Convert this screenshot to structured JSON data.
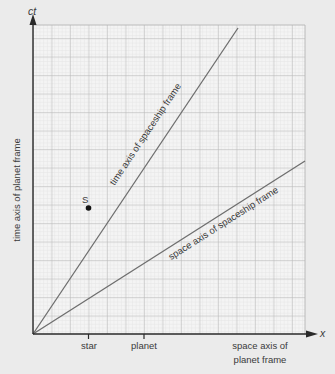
{
  "diagram": {
    "type": "spacetime-diagram",
    "axes": {
      "vertical": {
        "symbol": "ct",
        "label": "time axis of planet frame"
      },
      "horizontal": {
        "symbol": "x",
        "label_line1": "space axis of",
        "label_line2": "planet frame"
      }
    },
    "moving_frame": {
      "time_axis_label": "time axis of spaceship frame",
      "space_axis_label": "space axis of spaceship frame"
    },
    "x_ticks": [
      {
        "label": "star",
        "units": 3
      },
      {
        "label": "planet",
        "units": 6
      }
    ],
    "event": {
      "label": "S",
      "x_units": 3,
      "ct_units": 6.8
    },
    "colors": {
      "background": "#ebebeb",
      "grid_fill": "#f4f4f4",
      "grid_major": "#b4b4b4",
      "grid_minor": "#d8d8d8",
      "axis": "#2a2a2a",
      "frame_lines": "#6e6e6e",
      "text": "#3a3a3a"
    }
  }
}
